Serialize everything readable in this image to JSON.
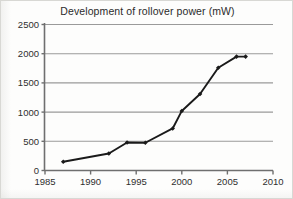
{
  "figure": {
    "title": "Development of rollover power (mW)"
  },
  "chart_data": {
    "type": "line",
    "title": "Development of rollover power (mW)",
    "xlabel": "",
    "ylabel": "",
    "xlim": [
      1985,
      2010
    ],
    "ylim": [
      0,
      2500
    ],
    "xticks": [
      1985,
      1990,
      1995,
      2000,
      2005,
      2010
    ],
    "yticks": [
      0,
      500,
      1000,
      1500,
      2000,
      2500
    ],
    "xtick_labels": [
      "1985",
      "1990",
      "1995",
      "2000",
      "2005",
      "2010"
    ],
    "ytick_labels": [
      "0",
      "500",
      "1000",
      "1500",
      "2000",
      "2500"
    ],
    "grid": "horizontal",
    "legend": "none",
    "series": [
      {
        "name": "rollover power",
        "marker": "diamond",
        "color": "#1a1a1a",
        "x": [
          1987,
          1992,
          1994,
          1996,
          1999,
          2000,
          2002,
          2004,
          2006,
          2007
        ],
        "y": [
          150,
          290,
          480,
          475,
          720,
          1020,
          1310,
          1760,
          1950,
          1950
        ]
      }
    ]
  },
  "style": {
    "line_color": "#1a1a1a",
    "grid_color": "#9a9a9a",
    "axis_color": "#6f6f6f",
    "text_color": "#2f2f2f",
    "background": "#fdfdfc"
  }
}
